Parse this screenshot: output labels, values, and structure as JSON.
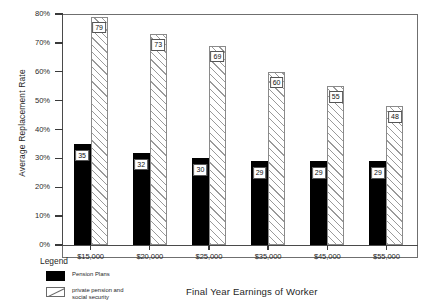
{
  "chart_data": {
    "type": "bar",
    "title": "",
    "xlabel": "Final Year Earnings of Worker",
    "ylabel": "Average Replacement Rate",
    "categories": [
      "$15,000",
      "$20,000",
      "$25,000",
      "$35,000",
      "$45,000",
      "$55,000"
    ],
    "series": [
      {
        "name": "Pension Plans",
        "values": [
          35,
          32,
          30,
          29,
          29,
          29
        ]
      },
      {
        "name": "private pension and social security",
        "values": [
          79,
          73,
          69,
          60,
          55,
          48
        ]
      }
    ],
    "ylim": [
      0,
      80
    ],
    "yticks": [
      0,
      10,
      20,
      30,
      40,
      50,
      60,
      70,
      80
    ],
    "ytick_labels": [
      "0%",
      "10%",
      "20%",
      "30%",
      "40%",
      "50%",
      "60%",
      "70%",
      "80%"
    ],
    "grid": false,
    "legend_position": "below-left",
    "value_labels": true
  },
  "legend": {
    "title": "Legend",
    "entries": [
      {
        "label": "Pension Plans",
        "swatch": "solid-black"
      },
      {
        "label": "private pension and social security",
        "swatch": "diagonal-hatch"
      }
    ]
  },
  "colors": {
    "series1": "#000000",
    "series2_fill": "#ffffff",
    "series2_hatch": "#9a9a9a",
    "axis": "#4a4a4a",
    "text": "#1f1f1f"
  }
}
